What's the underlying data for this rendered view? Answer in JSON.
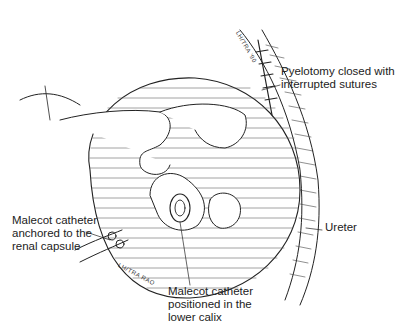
{
  "figure": {
    "type": "surgical-illustration",
    "labels": [
      {
        "id": "pyelotomy",
        "text": "Pyelotomy closed with\ninterrupted sutures",
        "x": 281,
        "y": 65
      },
      {
        "id": "malecot-anchored",
        "text": "Malecot catheter\nanchored to the\nrenal capsule",
        "x": 12,
        "y": 214
      },
      {
        "id": "ureter",
        "text": "Ureter",
        "x": 325,
        "y": 227
      },
      {
        "id": "malecot-calix",
        "text": "Malecot catheter\npositioned in the\nlower calix",
        "x": 168,
        "y": 285
      }
    ],
    "signatures": [
      "LH/TRA '90",
      "LH/TRA RAO"
    ]
  }
}
